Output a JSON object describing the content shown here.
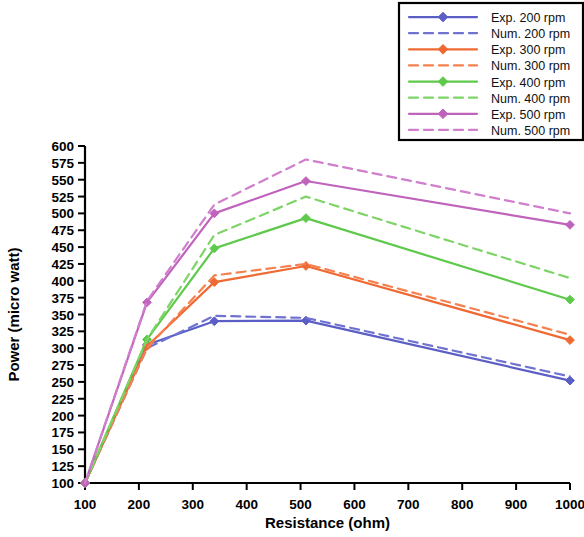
{
  "chart_data": {
    "type": "line",
    "title": "",
    "xlabel": "Resistance (ohm)",
    "ylabel": "Power (micro watt)",
    "xlim": [
      100,
      1000
    ],
    "ylim": [
      100,
      600
    ],
    "xticks": [
      100,
      200,
      300,
      400,
      500,
      600,
      700,
      800,
      900,
      1000
    ],
    "yticks": [
      100,
      125,
      150,
      175,
      200,
      225,
      250,
      275,
      300,
      325,
      350,
      375,
      400,
      425,
      450,
      475,
      500,
      525,
      550,
      575,
      600
    ],
    "grid": false,
    "legend_position": "top-right",
    "x": [
      100,
      215,
      340,
      510,
      1000
    ],
    "series": [
      {
        "name": "Exp. 200 rpm",
        "style": "solid",
        "marker": "diamond",
        "color": "#5b5ec4",
        "values": [
          100,
          305,
          340,
          341,
          252
        ]
      },
      {
        "name": "Num. 200 rpm",
        "style": "dashed",
        "marker": "none",
        "color": "#6f72cf",
        "values": [
          100,
          300,
          348,
          345,
          258
        ]
      },
      {
        "name": "Exp. 300 rpm",
        "style": "solid",
        "marker": "diamond",
        "color": "#ef6a33",
        "values": [
          100,
          303,
          398,
          422,
          312
        ]
      },
      {
        "name": "Num. 300 rpm",
        "style": "dashed",
        "marker": "none",
        "color": "#f4814f",
        "values": [
          100,
          300,
          408,
          425,
          320
        ]
      },
      {
        "name": "Exp. 400 rpm",
        "style": "solid",
        "marker": "diamond",
        "color": "#5ec94b",
        "values": [
          100,
          313,
          448,
          493,
          372
        ]
      },
      {
        "name": "Num. 400 rpm",
        "style": "dashed",
        "marker": "none",
        "color": "#7fd468",
        "values": [
          100,
          313,
          468,
          525,
          404
        ]
      },
      {
        "name": "Exp. 500 rpm",
        "style": "solid",
        "marker": "diamond",
        "color": "#c063bd",
        "values": [
          100,
          368,
          500,
          548,
          483
        ]
      },
      {
        "name": "Num. 500 rpm",
        "style": "dashed",
        "marker": "none",
        "color": "#d07fcd",
        "values": [
          100,
          370,
          513,
          580,
          500
        ]
      }
    ]
  },
  "legend": {
    "items": [
      {
        "label": "Exp. 200 rpm"
      },
      {
        "label": "Num. 200 rpm"
      },
      {
        "label": "Exp. 300 rpm"
      },
      {
        "label": "Num. 300 rpm"
      },
      {
        "label": "Exp. 400 rpm"
      },
      {
        "label": "Num. 400 rpm"
      },
      {
        "label": "Exp. 500 rpm"
      },
      {
        "label": "Num. 500 rpm"
      }
    ]
  }
}
